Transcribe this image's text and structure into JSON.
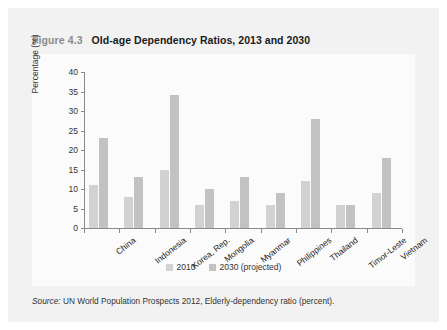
{
  "figure": {
    "number": "Figure 4.3",
    "title": "Old-age Dependency Ratios, 2013 and 2030"
  },
  "source": {
    "label": "Source:",
    "text": "UN World Population Prospects 2012, Elderly-dependency ratio (percent)."
  },
  "legend": {
    "position": "bottom-center",
    "items": [
      {
        "label": "2010",
        "color": "#d2d2d2"
      },
      {
        "label": "2030 (projected)",
        "color": "#c2c2c2"
      }
    ]
  },
  "colors": {
    "figure_background": "#f2f2f2",
    "plot_background": "#fbfbfb",
    "series_2010": "#d2d2d2",
    "series_2030": "#c2c2c2",
    "axis": "#8a8a8a",
    "title_text": "#1a1a1a",
    "figure_number_text": "#8c8c8c"
  },
  "chart_data": {
    "type": "bar",
    "title": "Old-age Dependency Ratios, 2013 and 2030",
    "xlabel": "",
    "ylabel": "Percentage (%)",
    "ylim": [
      0,
      40
    ],
    "yticks": [
      0,
      5,
      10,
      15,
      20,
      25,
      30,
      35,
      40
    ],
    "grid": false,
    "legend": "bottom-center",
    "categories": [
      "China",
      "Indonesia",
      "Korea, Rep.",
      "Mongolia",
      "Myanmar",
      "Philippines",
      "Thailand",
      "Timor-Leste",
      "Vietnam"
    ],
    "series": [
      {
        "name": "2010",
        "color": "#d2d2d2",
        "values": [
          11,
          8,
          15,
          6,
          7,
          6,
          12,
          6,
          9
        ]
      },
      {
        "name": "2030 (projected)",
        "color": "#c2c2c2",
        "values": [
          23,
          13,
          34,
          10,
          13,
          9,
          28,
          6,
          18
        ]
      }
    ]
  }
}
